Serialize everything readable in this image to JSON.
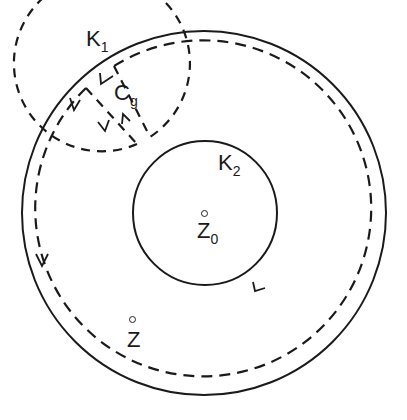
{
  "figure": {
    "labels": {
      "k1": {
        "base": "K",
        "sub": "1"
      },
      "k2": {
        "base": "K",
        "sub": "2"
      },
      "cg": {
        "base": "C",
        "sub": "g"
      },
      "z0": {
        "base": "Z",
        "sub": "0"
      },
      "z": {
        "base": "Z",
        "sub": ""
      }
    },
    "colors": {
      "stroke": "#1a1a1a",
      "background": "#ffffff"
    }
  }
}
